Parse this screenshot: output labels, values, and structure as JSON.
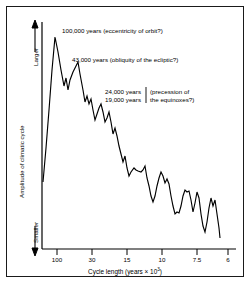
{
  "figure": {
    "background": "#ffffff",
    "line_color": "#000000",
    "border_color": "#1a1a1a"
  },
  "axes": {
    "y_title": "Amplitude of climatic cycle",
    "y_top_label": "Larger",
    "y_bottom_label": "Smaller",
    "x_title_prefix": "Cycle length (years × 10",
    "x_title_exponent": "3",
    "x_title_suffix": ")"
  },
  "annotations": [
    {
      "id": "eccentricity",
      "text": "100,000 years (eccentricity of orbit?)"
    },
    {
      "id": "obliquity",
      "text": "43,000 years (obliquity of the ecliptic?)"
    },
    {
      "id": "precession-periods-1",
      "text": "24,000 years"
    },
    {
      "id": "precession-periods-2",
      "text": "19,000 years"
    },
    {
      "id": "precession-name-1",
      "text": "(precession of"
    },
    {
      "id": "precession-name-2",
      "text": "the equinoxes?)"
    }
  ],
  "chart_data": {
    "type": "line",
    "title": "",
    "xlabel": "Cycle length (years × 10³)",
    "ylabel": "Amplitude of climatic cycle",
    "xlim": [
      130,
      5.6
    ],
    "ylim": [
      0,
      1
    ],
    "grid": false,
    "legend": null,
    "x_scale": "reciprocal-linear",
    "xticks": [
      100,
      30,
      15,
      10,
      7.5,
      6
    ],
    "xticklabels": [
      "100",
      "30",
      "15",
      "10",
      "7.5",
      "6"
    ],
    "xtick_px": [
      57,
      92,
      127,
      162,
      197,
      228
    ],
    "yticks": [],
    "yticklabels": [],
    "y_direction_labels": [
      "Smaller",
      "Larger"
    ],
    "peaks": [
      {
        "label": "100,000 years",
        "cause": "eccentricity of orbit?"
      },
      {
        "label": "43,000 years",
        "cause": "obliquity of the ecliptic?"
      },
      {
        "label": "24,000 years",
        "cause": "precession of the equinoxes?"
      },
      {
        "label": "19,000 years",
        "cause": "precession of the equinoxes?"
      }
    ],
    "series": [
      {
        "name": "spectral amplitude",
        "points_px": [
          [
            43,
            182
          ],
          [
            46,
            148
          ],
          [
            49,
            110
          ],
          [
            52,
            70
          ],
          [
            55,
            37
          ],
          [
            58,
            52
          ],
          [
            61,
            70
          ],
          [
            64,
            86
          ],
          [
            66,
            78
          ],
          [
            68,
            90
          ],
          [
            70,
            80
          ],
          [
            73,
            72
          ],
          [
            76,
            66
          ],
          [
            78,
            62
          ],
          [
            80,
            74
          ],
          [
            83,
            90
          ],
          [
            85,
            102
          ],
          [
            87,
            96
          ],
          [
            89,
            104
          ],
          [
            91,
            99
          ],
          [
            93,
            110
          ],
          [
            95,
            120
          ],
          [
            97,
            114
          ],
          [
            99,
            108
          ],
          [
            101,
            104
          ],
          [
            103,
            112
          ],
          [
            105,
            122
          ],
          [
            107,
            118
          ],
          [
            109,
            112
          ],
          [
            111,
            122
          ],
          [
            113,
            134
          ],
          [
            115,
            128
          ],
          [
            117,
            136
          ],
          [
            119,
            146
          ],
          [
            121,
            154
          ],
          [
            123,
            162
          ],
          [
            125,
            156
          ],
          [
            127,
            168
          ],
          [
            129,
            176
          ],
          [
            131,
            172
          ],
          [
            134,
            168
          ],
          [
            136,
            170
          ],
          [
            138,
            171
          ],
          [
            141,
            172
          ],
          [
            143,
            170
          ],
          [
            145,
            166
          ],
          [
            147,
            178
          ],
          [
            149,
            186
          ],
          [
            151,
            196
          ],
          [
            153,
            202
          ],
          [
            155,
            196
          ],
          [
            157,
            186
          ],
          [
            159,
            178
          ],
          [
            161,
            172
          ],
          [
            163,
            176
          ],
          [
            165,
            183
          ],
          [
            167,
            179
          ],
          [
            169,
            184
          ],
          [
            171,
            196
          ],
          [
            173,
            206
          ],
          [
            175,
            214
          ],
          [
            177,
            212
          ],
          [
            179,
            213
          ],
          [
            181,
            206
          ],
          [
            183,
            196
          ],
          [
            185,
            190
          ],
          [
            187,
            192
          ],
          [
            189,
            191
          ],
          [
            191,
            200
          ],
          [
            193,
            212
          ],
          [
            195,
            203
          ],
          [
            197,
            192
          ],
          [
            199,
            198
          ],
          [
            201,
            214
          ],
          [
            203,
            226
          ],
          [
            205,
            232
          ],
          [
            207,
            222
          ],
          [
            209,
            208
          ],
          [
            211,
            198
          ],
          [
            213,
            206
          ],
          [
            215,
            200
          ],
          [
            217,
            214
          ],
          [
            219,
            228
          ],
          [
            220,
            238
          ]
        ]
      }
    ]
  }
}
